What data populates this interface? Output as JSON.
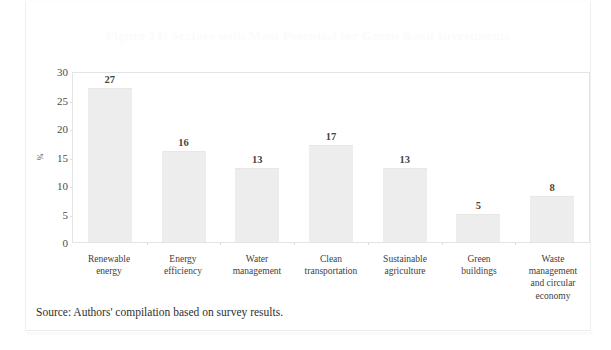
{
  "page": {
    "title_text": "Figure 14: Sectors with Most Potential for Green Bond Investments",
    "source_note": "Source: Authors' compilation based on survey results.",
    "frame_color": "#f0f0f0",
    "bar_color": "#ededed",
    "text_color": "#3e3e3e"
  },
  "chart_data": {
    "type": "bar",
    "title": "Figure 14: Sectors with Most Potential for Green Bond Investments",
    "xlabel": "",
    "ylabel": "%",
    "ylim": [
      0,
      30
    ],
    "yticks": [
      0,
      5,
      10,
      15,
      20,
      25,
      30
    ],
    "ytick_labels": [
      "0",
      "5",
      "10",
      "15",
      "20",
      "25",
      "30"
    ],
    "grid": false,
    "legend": null,
    "data_labels": true,
    "categories": [
      "Renewable energy",
      "Energy efficiency",
      "Water management",
      "Clean transportation",
      "Sustainable agriculture",
      "Green buildings",
      "Waste management and circular economy"
    ],
    "category_lines": [
      [
        "Renewable",
        "energy"
      ],
      [
        "Energy",
        "efficiency"
      ],
      [
        "Water",
        "management"
      ],
      [
        "Clean",
        "transportation"
      ],
      [
        "Sustainable",
        "agriculture"
      ],
      [
        "Green",
        "buildings"
      ],
      [
        "Waste",
        "management",
        "and circular",
        "economy"
      ]
    ],
    "values": [
      27,
      16,
      13,
      17,
      13,
      5,
      8
    ],
    "value_labels": [
      "27",
      "16",
      "13",
      "17",
      "13",
      "5",
      "8"
    ]
  }
}
